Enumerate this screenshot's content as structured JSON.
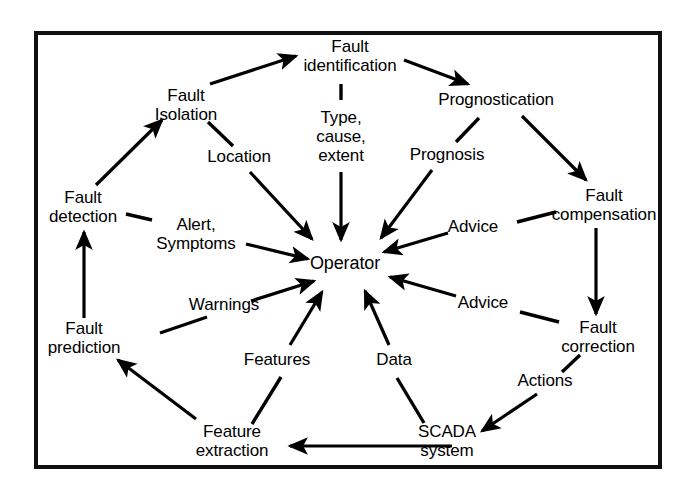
{
  "diagram": {
    "frame": {
      "border_color": "#111111",
      "background_color": "#ffffff"
    },
    "ink_color": "#000000",
    "hub": {
      "id": "operator",
      "label": "Operator",
      "x": 345,
      "y": 263
    },
    "nodes": [
      {
        "id": "fault-identification",
        "label": "Fault\nidentification",
        "x": 350,
        "y": 56
      },
      {
        "id": "fault-isolation",
        "label": "Fault\nIsolation",
        "x": 186,
        "y": 105
      },
      {
        "id": "fault-detection",
        "label": "Fault\ndetection",
        "x": 83,
        "y": 207
      },
      {
        "id": "fault-prediction",
        "label": "Fault\nprediction",
        "x": 84,
        "y": 338
      },
      {
        "id": "feature-extraction",
        "label": "Feature\nextraction",
        "x": 232,
        "y": 441
      },
      {
        "id": "scada-system",
        "label": "SCADA\nsystem",
        "x": 447,
        "y": 441
      },
      {
        "id": "fault-correction",
        "label": "Fault\ncorrection",
        "x": 598,
        "y": 337
      },
      {
        "id": "fault-compensation",
        "label": "Fault\ncompensation",
        "x": 604,
        "y": 205
      },
      {
        "id": "prognostication",
        "label": "Prognostication",
        "x": 496,
        "y": 100
      }
    ],
    "edge_labels": [
      {
        "id": "type-cause-extent",
        "label": "Type,\ncause,\nextent",
        "x": 341,
        "y": 137
      },
      {
        "id": "location",
        "label": "Location",
        "x": 239,
        "y": 157
      },
      {
        "id": "alert-symptoms",
        "label": "Alert,\nSymptoms",
        "x": 196,
        "y": 234
      },
      {
        "id": "warnings",
        "label": "Warnings",
        "x": 224,
        "y": 305
      },
      {
        "id": "features",
        "label": "Features",
        "x": 277,
        "y": 360
      },
      {
        "id": "data",
        "label": "Data",
        "x": 394,
        "y": 360
      },
      {
        "id": "advice-lower",
        "label": "Advice",
        "x": 483,
        "y": 303
      },
      {
        "id": "advice-upper",
        "label": "Advice",
        "x": 473,
        "y": 227
      },
      {
        "id": "prognosis",
        "label": "Prognosis",
        "x": 447,
        "y": 155
      },
      {
        "id": "actions",
        "label": "Actions",
        "x": 545,
        "y": 381
      }
    ],
    "edges": [
      {
        "id": "fault-detection-to-fault-isolation",
        "from": "fault-detection",
        "to": "fault-isolation",
        "kind": "arrow",
        "x1": 96,
        "y1": 185,
        "x2": 162,
        "y2": 120
      },
      {
        "id": "fault-isolation-to-fault-identification",
        "from": "fault-isolation",
        "to": "fault-identification",
        "kind": "arrow",
        "x1": 210,
        "y1": 84,
        "x2": 296,
        "y2": 56
      },
      {
        "id": "fault-identification-to-prognostication",
        "from": "fault-identification",
        "to": "prognostication",
        "kind": "arrow",
        "x1": 404,
        "y1": 60,
        "x2": 468,
        "y2": 84
      },
      {
        "id": "prognostication-to-fault-compensation",
        "from": "prognostication",
        "to": "fault-compensation",
        "kind": "arrow",
        "x1": 522,
        "y1": 116,
        "x2": 586,
        "y2": 180
      },
      {
        "id": "fault-compensation-to-fault-correction",
        "from": "fault-compensation",
        "to": "fault-correction",
        "kind": "arrow",
        "x1": 596,
        "y1": 228,
        "x2": 596,
        "y2": 314
      },
      {
        "id": "scada-system-to-feature-extraction",
        "from": "scada-system",
        "to": "feature-extraction",
        "kind": "arrow",
        "x1": 452,
        "y1": 446,
        "x2": 290,
        "y2": 446
      },
      {
        "id": "feature-extraction-to-fault-prediction",
        "from": "feature-extraction",
        "to": "fault-prediction",
        "kind": "arrow",
        "x1": 196,
        "y1": 419,
        "x2": 118,
        "y2": 360
      },
      {
        "id": "fault-prediction-to-fault-detection",
        "from": "fault-prediction",
        "to": "fault-detection",
        "kind": "arrow",
        "x1": 84,
        "y1": 318,
        "x2": 84,
        "y2": 232
      },
      {
        "id": "fault-isolation-location-stub",
        "from": "fault-isolation",
        "to": "location",
        "kind": "line",
        "x1": 208,
        "y1": 122,
        "x2": 233,
        "y2": 146
      },
      {
        "id": "location-to-operator",
        "from": "location",
        "to": "operator",
        "kind": "arrow",
        "x1": 250,
        "y1": 172,
        "x2": 312,
        "y2": 239
      },
      {
        "id": "fault-identification-type-stub",
        "from": "fault-identification",
        "to": "type-cause-extent",
        "kind": "line",
        "x1": 341,
        "y1": 84,
        "x2": 341,
        "y2": 100
      },
      {
        "id": "type-cause-extent-to-operator",
        "from": "type-cause-extent",
        "to": "operator",
        "kind": "arrow",
        "x1": 341,
        "y1": 172,
        "x2": 341,
        "y2": 240
      },
      {
        "id": "prognostication-prognosis-stub",
        "from": "prognostication",
        "to": "prognosis",
        "kind": "line",
        "x1": 479,
        "y1": 118,
        "x2": 456,
        "y2": 142
      },
      {
        "id": "prognosis-to-operator",
        "from": "prognosis",
        "to": "operator",
        "kind": "arrow",
        "x1": 432,
        "y1": 170,
        "x2": 381,
        "y2": 238
      },
      {
        "id": "fault-compensation-advice-stub",
        "from": "fault-compensation",
        "to": "advice-upper",
        "kind": "line",
        "x1": 556,
        "y1": 212,
        "x2": 517,
        "y2": 222
      },
      {
        "id": "advice-upper-to-operator",
        "from": "advice-upper",
        "to": "operator",
        "kind": "arrow",
        "x1": 448,
        "y1": 233,
        "x2": 384,
        "y2": 252
      },
      {
        "id": "fault-correction-advice-stub",
        "from": "fault-correction",
        "to": "advice-lower",
        "kind": "line",
        "x1": 559,
        "y1": 322,
        "x2": 520,
        "y2": 312
      },
      {
        "id": "advice-lower-to-operator",
        "from": "advice-lower",
        "to": "operator",
        "kind": "arrow",
        "x1": 456,
        "y1": 296,
        "x2": 390,
        "y2": 277
      },
      {
        "id": "scada-system-data-stub",
        "from": "scada-system",
        "to": "data",
        "kind": "line",
        "x1": 424,
        "y1": 423,
        "x2": 397,
        "y2": 378
      },
      {
        "id": "data-to-operator",
        "from": "data",
        "to": "operator",
        "kind": "arrow",
        "x1": 389,
        "y1": 345,
        "x2": 365,
        "y2": 291
      },
      {
        "id": "feature-extraction-features-stub",
        "from": "feature-extraction",
        "to": "features",
        "kind": "line",
        "x1": 252,
        "y1": 424,
        "x2": 281,
        "y2": 377
      },
      {
        "id": "features-to-operator",
        "from": "features",
        "to": "operator",
        "kind": "arrow",
        "x1": 290,
        "y1": 345,
        "x2": 322,
        "y2": 292
      },
      {
        "id": "fault-prediction-warnings-stub",
        "from": "fault-prediction",
        "to": "warnings",
        "kind": "line",
        "x1": 160,
        "y1": 333,
        "x2": 207,
        "y2": 317
      },
      {
        "id": "warnings-to-operator",
        "from": "warnings",
        "to": "operator",
        "kind": "arrow",
        "x1": 251,
        "y1": 301,
        "x2": 314,
        "y2": 281
      },
      {
        "id": "fault-detection-alert-stub",
        "from": "fault-detection",
        "to": "alert-symptoms",
        "kind": "line",
        "x1": 126,
        "y1": 214,
        "x2": 152,
        "y2": 220
      },
      {
        "id": "alert-symptoms-to-operator",
        "from": "alert-symptoms",
        "to": "operator",
        "kind": "arrow",
        "x1": 246,
        "y1": 244,
        "x2": 308,
        "y2": 259
      },
      {
        "id": "fault-correction-actions-stub",
        "from": "fault-correction",
        "to": "actions",
        "kind": "line",
        "x1": 580,
        "y1": 355,
        "x2": 562,
        "y2": 372
      },
      {
        "id": "actions-to-scada-system",
        "from": "actions",
        "to": "scada-system",
        "kind": "arrow",
        "x1": 537,
        "y1": 394,
        "x2": 482,
        "y2": 431
      }
    ]
  }
}
